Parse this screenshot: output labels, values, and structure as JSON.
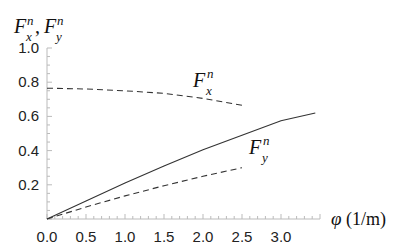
{
  "chart_data": {
    "type": "line",
    "title": "",
    "ylabel": "F_x^n, F_y^n",
    "xlabel": "φ (1/m)",
    "xlim": [
      0,
      3.5
    ],
    "ylim": [
      0,
      1.0
    ],
    "grid": false,
    "x_ticks": [
      "0.0",
      "0.5",
      "1.0",
      "1.5",
      "2.0",
      "2.5",
      "3.0"
    ],
    "y_ticks": [
      "0.2",
      "0.4",
      "0.6",
      "0.8",
      "1.0"
    ],
    "legend": "inline annotations",
    "series": [
      {
        "name": "F_x^n",
        "style": "dashed",
        "x": [
          0.0,
          0.5,
          1.0,
          1.5,
          2.0,
          2.5
        ],
        "y": [
          0.765,
          0.76,
          0.75,
          0.735,
          0.705,
          0.665
        ]
      },
      {
        "name": "F_y^n",
        "style": "dashed",
        "x": [
          0.0,
          0.5,
          1.0,
          1.5,
          2.0,
          2.5
        ],
        "y": [
          0.0,
          0.07,
          0.135,
          0.195,
          0.25,
          0.3
        ]
      },
      {
        "name": "solid",
        "style": "solid",
        "x": [
          0.0,
          0.5,
          1.0,
          1.5,
          2.0,
          2.5,
          3.0,
          3.44
        ],
        "y": [
          0.0,
          0.105,
          0.21,
          0.31,
          0.405,
          0.49,
          0.575,
          0.62
        ]
      }
    ],
    "annotations": [
      {
        "text": "F_x^n",
        "near_x": 1.9,
        "near_y": 0.8
      },
      {
        "text": "F_y^n",
        "near_x": 2.7,
        "near_y": 0.38
      }
    ]
  },
  "labels": {
    "y_axis_F": "F",
    "y_axis_sub_x": "x",
    "y_axis_sub_y": "y",
    "sup_n": "n",
    "comma": ",",
    "x_axis_phi": "φ",
    "x_axis_unit": "(1/m)",
    "fx_main": "F",
    "fx_sub": "x",
    "fy_main": "F",
    "fy_sub": "y"
  }
}
